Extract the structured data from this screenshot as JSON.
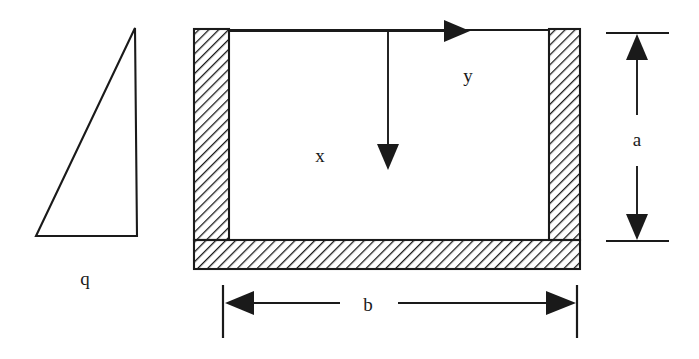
{
  "figure": {
    "background_color": "#ffffff",
    "line_color": "#1a1a1a"
  },
  "labels": {
    "load_triangle": "q",
    "axis_x": "x",
    "axis_y": "y",
    "dimension_height": "a",
    "dimension_width": "b"
  },
  "geometry": {
    "triangle": {
      "apex": [
        135,
        28
      ],
      "bottom_left": [
        36,
        236
      ],
      "bottom_right": [
        137,
        236
      ]
    },
    "channel": {
      "outer_left": 194,
      "inner_left": 229,
      "inner_right": 549,
      "outer_right": 580,
      "top": 29,
      "flange_top": 240,
      "outer_bottom": 269,
      "wall_thickness": 35,
      "flange_thickness": 29
    },
    "axes": {
      "origin": [
        229,
        31
      ],
      "y_arrow_tip": [
        470,
        31
      ],
      "x_arrow_tip": [
        388,
        170
      ],
      "x_axis_start": [
        388,
        31
      ]
    },
    "dimension_a": {
      "x": 637,
      "top_tick_y": 33,
      "bottom_tick_y": 241,
      "tick_half_width": 30
    },
    "dimension_b": {
      "y": 303,
      "left_x": 223,
      "right_x": 577,
      "ext_top": 285,
      "ext_bottom": 338
    }
  },
  "hatching": {
    "pattern": "diagonal-45",
    "spacing_px": 7,
    "angle_deg": 45,
    "color": "#1a1a1a"
  }
}
